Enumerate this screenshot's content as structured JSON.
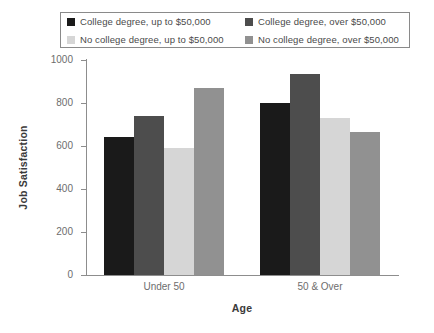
{
  "chart_data": {
    "type": "bar",
    "title": "",
    "subtitle": "",
    "xlabel": "Age",
    "ylabel": "Job Satisfaction",
    "categories": [
      "Under 50",
      "50 & Over"
    ],
    "ylim": [
      0,
      1000
    ],
    "yticks": [
      0,
      200,
      400,
      600,
      800,
      1000
    ],
    "ytick_labels": [
      "0",
      "200",
      "400",
      "600",
      "800",
      "1000"
    ],
    "grid": false,
    "legend_position": "top",
    "series": [
      {
        "name": "College degree, up to $50,000",
        "color": "#1a1a1a",
        "values": [
          640,
          800
        ]
      },
      {
        "name": "College degree, over $50,000",
        "color": "#4d4d4d",
        "values": [
          740,
          935
        ]
      },
      {
        "name": "No college degree, up to $50,000",
        "color": "#d6d6d6",
        "values": [
          590,
          730
        ]
      },
      {
        "name": "No college degree, over $50,000",
        "color": "#919191",
        "values": [
          870,
          665
        ]
      }
    ]
  },
  "legend": {
    "entries": [
      {
        "label": "College degree, up to $50,000",
        "color": "#1a1a1a"
      },
      {
        "label": "College degree, over $50,000",
        "color": "#4d4d4d"
      },
      {
        "label": "No college degree, up to $50,000",
        "color": "#d6d6d6"
      },
      {
        "label": "No college degree, over $50,000",
        "color": "#919191"
      }
    ]
  },
  "axes": {
    "y_title": "Job Satisfaction",
    "x_title": "Age",
    "y_labels": [
      "1000",
      "800",
      "600",
      "400",
      "200",
      "0"
    ],
    "x_labels": [
      "Under 50",
      "50 & Over"
    ]
  }
}
